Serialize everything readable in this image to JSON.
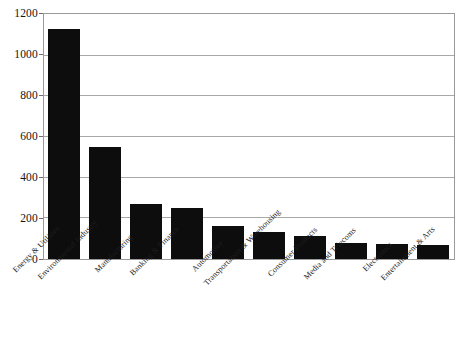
{
  "chart_data": {
    "type": "bar",
    "title": "",
    "subtitle": "",
    "xlabel": "",
    "ylabel": "",
    "ylim": [
      0,
      1200
    ],
    "ytick_labels": [
      "0",
      "200",
      "400",
      "600",
      "800",
      "1000",
      "1200"
    ],
    "yticks": [
      0,
      200,
      400,
      600,
      800,
      1000,
      1200
    ],
    "grid": true,
    "legend": null,
    "bar_color": "#0d0d0d",
    "gridline_color": "#a8a8a8",
    "background_color": "#ffffff",
    "categories": [
      "Energy & Utilities",
      "Environmental Industry",
      "Manufacturing",
      "Banking & Finance",
      "Automotive",
      "Transportation & Warehousing",
      "Consumer Products",
      "Media and Telecoms",
      "Electronics",
      "Entertainment & Arts"
    ],
    "values": [
      1130,
      550,
      273,
      250,
      160,
      133,
      113,
      77,
      74,
      70
    ]
  }
}
